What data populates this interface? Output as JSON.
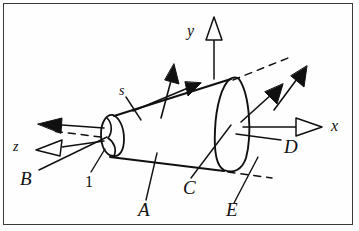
{
  "figure": {
    "kind": "engineering-line-diagram",
    "frame_color": "#3a3a3c",
    "ink_color": "#101010",
    "background_color": "#fefefe"
  },
  "axes": [
    {
      "id": "y",
      "label": "y",
      "direction": "up",
      "arrowhead": "hollow-triangle"
    },
    {
      "id": "x",
      "label": "x",
      "direction": "right",
      "arrowhead": "hollow-triangle"
    },
    {
      "id": "z",
      "label": "z",
      "direction": "left-down",
      "arrowhead": "hollow-triangle"
    }
  ],
  "labels": {
    "y_axis": "y",
    "x_axis": "x",
    "z_axis": "z",
    "arc_length": "s",
    "surface_b": "B",
    "surface_a": "A",
    "surface_c": "C",
    "surface_d": "D",
    "surface_e": "E",
    "station_1": "1"
  },
  "annotations": [
    {
      "name": "arc-length-label",
      "text": "s",
      "leader": true,
      "note": "meridian / slant coordinate on cone surface"
    },
    {
      "name": "station-1-label",
      "text": "1",
      "leader": true,
      "note": "small end face of frustum"
    },
    {
      "name": "surface-b-label",
      "text": "B",
      "leader": true,
      "note": "vector at small end, pointing left along -x"
    },
    {
      "name": "surface-a-label",
      "text": "A",
      "leader": true,
      "note": "lower generator / lateral surface"
    },
    {
      "name": "surface-c-label",
      "text": "C",
      "leader": true,
      "note": "lateral surface near large end"
    },
    {
      "name": "surface-d-label",
      "text": "D",
      "leader": true,
      "note": "vector on large end face along +x"
    },
    {
      "name": "surface-e-label",
      "text": "E",
      "leader": true,
      "note": "large end face rim"
    }
  ],
  "vectors": [
    {
      "name": "normal-vector-top",
      "style": "solid-filled-arrow",
      "direction": "up"
    },
    {
      "name": "tangent-vector-top",
      "style": "solid-filled-arrow",
      "direction": "up-right-along-generator"
    },
    {
      "name": "flux-vector-left",
      "style": "solid-filled-arrow",
      "direction": "left"
    },
    {
      "name": "flux-vector-right-inner",
      "style": "solid-filled-arrow",
      "direction": "up-right"
    },
    {
      "name": "flux-vector-right-outer",
      "style": "solid-filled-arrow",
      "direction": "up-right"
    }
  ],
  "dashed_elements": [
    {
      "name": "axis-extension-upper-right",
      "note": "dashed construction line from large end toward upper right"
    },
    {
      "name": "axis-extension-lower-right",
      "note": "short dashed construction line below large end"
    },
    {
      "name": "axis-extension-left",
      "note": "dashed construction line along z toward lower left"
    }
  ]
}
